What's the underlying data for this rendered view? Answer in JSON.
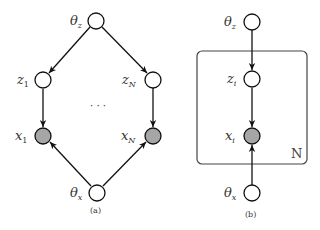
{
  "panels": {
    "a": {
      "caption": "(a)",
      "nodes": {
        "theta_z": {
          "base": "θ",
          "sub": "z",
          "observed": false
        },
        "z1": {
          "base": "z",
          "sub": "1",
          "observed": false
        },
        "zN": {
          "base": "z",
          "sub": "N",
          "observed": false
        },
        "x1": {
          "base": "x",
          "sub": "1",
          "observed": true
        },
        "xN": {
          "base": "x",
          "sub": "N",
          "observed": true
        },
        "theta_x": {
          "base": "θ",
          "sub": "x",
          "observed": false
        }
      },
      "ellipsis": "· · ·",
      "edges": [
        [
          "theta_z",
          "z1"
        ],
        [
          "theta_z",
          "zN"
        ],
        [
          "z1",
          "x1"
        ],
        [
          "zN",
          "xN"
        ],
        [
          "theta_x",
          "x1"
        ],
        [
          "theta_x",
          "xN"
        ]
      ]
    },
    "b": {
      "caption": "(b)",
      "nodes": {
        "theta_z": {
          "base": "θ",
          "sub": "z",
          "observed": false
        },
        "zi": {
          "base": "z",
          "sub": "i",
          "observed": false
        },
        "xi": {
          "base": "x",
          "sub": "i",
          "observed": true
        },
        "theta_x": {
          "base": "θ",
          "sub": "x",
          "observed": false
        }
      },
      "plate_label": "N",
      "edges": [
        [
          "theta_z",
          "zi"
        ],
        [
          "zi",
          "xi"
        ],
        [
          "theta_x",
          "xi"
        ]
      ]
    }
  },
  "colors": {
    "observed_fill": "#a6a6a6",
    "latent_fill": "#ffffff",
    "stroke": "#111111",
    "plate_stroke": "#444444"
  }
}
